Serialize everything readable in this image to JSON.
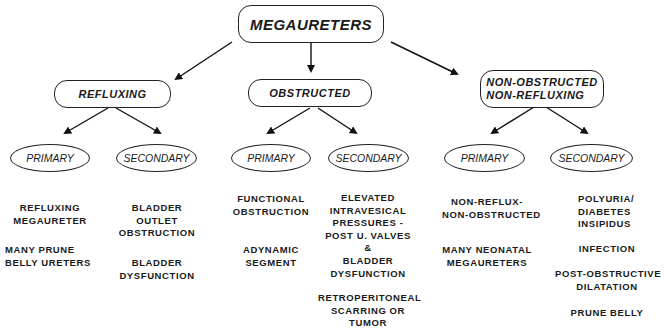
{
  "root": {
    "label": "MEGAURETERS"
  },
  "categories": [
    {
      "label": "REFLUXING",
      "primary": {
        "label": "PRIMARY",
        "items": [
          "REFLUXING\nMEGAURETER",
          "MANY PRUNE\nBELLY URETERS"
        ]
      },
      "secondary": {
        "label": "SECONDARY",
        "items": [
          "BLADDER\nOUTLET\nOBSTRUCTION",
          "BLADDER\nDYSFUNCTION"
        ]
      }
    },
    {
      "label": "OBSTRUCTED",
      "primary": {
        "label": "PRIMARY",
        "items": [
          "FUNCTIONAL\nOBSTRUCTION",
          "ADYNAMIC\nSEGMENT"
        ]
      },
      "secondary": {
        "label": "SECONDARY",
        "items": [
          "ELEVATED\nINTRAVESICAL\nPRESSURES -\nPOST U. VALVES\n&\nBLADDER\nDYSFUNCTION",
          "RETROPERITONEAL\nSCARRING OR\nTUMOR"
        ]
      }
    },
    {
      "label": "NON-OBSTRUCTED\nNON-REFLUXING",
      "primary": {
        "label": "PRIMARY",
        "items": [
          "NON-REFLUX-\nNON-OBSTRUCTED",
          "MANY NEONATAL\nMEGAURETERS"
        ]
      },
      "secondary": {
        "label": "SECONDARY",
        "items": [
          "POLYURIA/\nDIABETES\nINSIPIDUS",
          "INFECTION",
          "POST-OBSTRUCTIVE\nDILATATION",
          "PRUNE BELLY"
        ]
      }
    }
  ]
}
